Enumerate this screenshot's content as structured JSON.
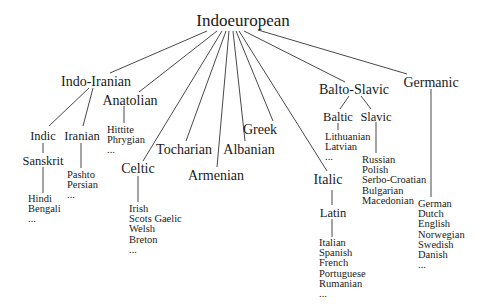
{
  "diagram": {
    "type": "tree",
    "title": "Indoeuropean",
    "root": {
      "label": "Indoeuropean",
      "children": [
        {
          "label": "Indo-Iranian",
          "children": [
            {
              "label": "Indic",
              "children": [
                {
                  "label": "Sanskrit",
                  "leaves": [
                    "Hindi",
                    "Bengali",
                    "..."
                  ]
                }
              ]
            },
            {
              "label": "Iranian",
              "leaves": [
                "Pashto",
                "Persian",
                "..."
              ]
            }
          ]
        },
        {
          "label": "Anatolian",
          "leaves": [
            "Hittite",
            "Phrygian",
            "..."
          ]
        },
        {
          "label": "Celtic",
          "leaves": [
            "Irish",
            "Scots Gaelic",
            "Welsh",
            "Breton",
            "..."
          ]
        },
        {
          "label": "Tocharian"
        },
        {
          "label": "Armenian"
        },
        {
          "label": "Albanian"
        },
        {
          "label": "Greek"
        },
        {
          "label": "Italic",
          "children": [
            {
              "label": "Latin",
              "leaves": [
                "Italian",
                "Spanish",
                "French",
                "Portuguese",
                "Rumanian",
                "..."
              ]
            }
          ]
        },
        {
          "label": "Balto-Slavic",
          "children": [
            {
              "label": "Baltic",
              "leaves": [
                "Lithuanian",
                "Latvian",
                "..."
              ]
            },
            {
              "label": "Slavic",
              "leaves": [
                "Russian",
                "Polish",
                "Serbo-Croatian",
                "Bulgarian",
                "Macedonian"
              ]
            }
          ]
        },
        {
          "label": "Germanic",
          "leaves": [
            "German",
            "Dutch",
            "English",
            "Norwegian",
            "Swedish",
            "Danish",
            "..."
          ]
        }
      ]
    }
  },
  "labels": {
    "indoeuropean": "Indoeuropean",
    "indo_iranian": "Indo-Iranian",
    "indic": "Indic",
    "iranian": "Iranian",
    "sanskrit": "Sanskrit",
    "anatolian": "Anatolian",
    "celtic": "Celtic",
    "tocharian": "Tocharian",
    "armenian": "Armenian",
    "albanian": "Albanian",
    "greek": "Greek",
    "italic": "Italic",
    "latin": "Latin",
    "balto_slavic": "Balto-Slavic",
    "baltic": "Baltic",
    "slavic": "Slavic",
    "germanic": "Germanic"
  },
  "leaves": {
    "sanskrit": [
      "Hindi",
      "Bengali",
      "..."
    ],
    "iranian": [
      "Pashto",
      "Persian",
      "..."
    ],
    "anatolian": [
      "Hittite",
      "Phrygian",
      "..."
    ],
    "celtic": [
      "Irish",
      "Scots Gaelic",
      "Welsh",
      "Breton",
      "..."
    ],
    "latin": [
      "Italian",
      "Spanish",
      "French",
      "Portuguese",
      "Rumanian",
      "..."
    ],
    "baltic": [
      "Lithuanian",
      "Latvian",
      "..."
    ],
    "slavic": [
      "Russian",
      "Polish",
      "Serbo-Croatian",
      "Bulgarian",
      "Macedonian"
    ],
    "germanic": [
      "German",
      "Dutch",
      "English",
      "Norwegian",
      "Swedish",
      "Danish",
      "..."
    ]
  }
}
